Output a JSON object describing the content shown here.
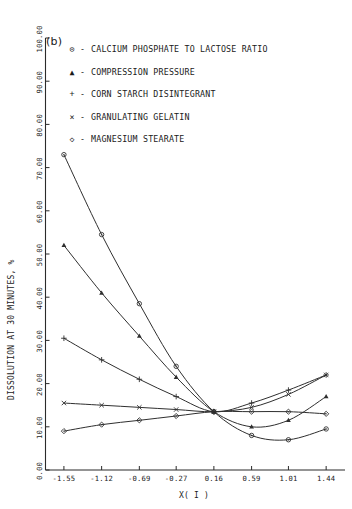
{
  "figure": {
    "panel_label": "(b)"
  },
  "chart_data": {
    "type": "line",
    "title": "(b)",
    "xlabel": "X( I )",
    "ylabel": "DISSOLUTION AT 30 MINUTES, %",
    "xlim": [
      -1.76,
      1.655
    ],
    "ylim": [
      0,
      100
    ],
    "grid": false,
    "legend_position": "top-right-inside",
    "x_ticks": [
      "-1.55",
      "-1.12",
      "-0.69",
      "-0.27",
      "0.16",
      "0.59",
      "1.01",
      "1.44"
    ],
    "x_tick_values": [
      -1.55,
      -1.12,
      -0.69,
      -0.27,
      0.16,
      0.59,
      1.01,
      1.44
    ],
    "y_ticks": [
      "0.00",
      "10.00",
      "20.00",
      "30.00",
      "40.00",
      "50.00",
      "60.00",
      "70.00",
      "80.00",
      "90.00",
      "100.00"
    ],
    "y_tick_values": [
      0,
      10,
      20,
      30,
      40,
      50,
      60,
      70,
      80,
      90,
      100
    ],
    "x": [
      -1.55,
      -1.12,
      -0.69,
      -0.27,
      0.16,
      0.59,
      1.01,
      1.44
    ],
    "series": [
      {
        "name": "CALCIUM PHOSPHATE TO LACTOSE RATIO",
        "symbol": "circle-dot",
        "glyph": "⊙",
        "values": [
          73.0,
          54.5,
          38.5,
          24.0,
          13.5,
          8.0,
          7.0,
          9.5
        ]
      },
      {
        "name": "COMPRESSION PRESSURE",
        "symbol": "triangle",
        "glyph": "▲",
        "values": [
          52.0,
          41.0,
          31.0,
          21.5,
          13.5,
          10.0,
          11.5,
          17.0
        ]
      },
      {
        "name": "CORN STARCH DISINTEGRANT",
        "symbol": "plus",
        "glyph": "+",
        "values": [
          30.5,
          25.5,
          21.0,
          17.0,
          13.5,
          15.5,
          18.5,
          22.0
        ]
      },
      {
        "name": "GRANULATING GELATIN",
        "symbol": "cross",
        "glyph": "×",
        "values": [
          15.5,
          15.0,
          14.5,
          14.0,
          13.5,
          14.5,
          17.5,
          22.0
        ]
      },
      {
        "name": "MAGNESIUM STEARATE",
        "symbol": "diamond-dot",
        "glyph": "◇",
        "values": [
          9.0,
          10.5,
          11.5,
          12.5,
          13.5,
          13.5,
          13.5,
          13.0
        ]
      }
    ]
  },
  "legend": {
    "items": [
      {
        "glyph": "⊙",
        "dash": "-",
        "label": "CALCIUM PHOSPHATE TO LACTOSE RATIO"
      },
      {
        "glyph": "▲",
        "dash": "-",
        "label": "COMPRESSION PRESSURE"
      },
      {
        "glyph": "+",
        "dash": "-",
        "label": "CORN STARCH DISINTEGRANT"
      },
      {
        "glyph": "×",
        "dash": "-",
        "label": "GRANULATING GELATIN"
      },
      {
        "glyph": "◇",
        "dash": "-",
        "label": "MAGNESIUM STEARATE"
      }
    ]
  }
}
